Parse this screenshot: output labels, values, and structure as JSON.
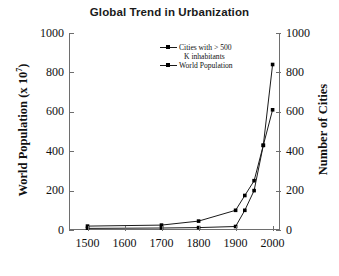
{
  "chart_data": {
    "type": "line",
    "title": "Global Trend in Urbanization",
    "xlabel": "",
    "ylabel": "World Population (x 10",
    "ylabel_exponent": "7",
    "ylabel_suffix": ")",
    "y2label": "Number of Cities",
    "xlim": [
      1450,
      2020
    ],
    "ylim": [
      0,
      1000
    ],
    "y2lim": [
      0,
      1000
    ],
    "grid": false,
    "legend_position": "top-center",
    "xticks": [
      "1500",
      "1600",
      "1700",
      "1800",
      "1900",
      "2000"
    ],
    "xtick_values": [
      1500,
      1600,
      1700,
      1800,
      1900,
      2000
    ],
    "yticks": [
      "0",
      "200",
      "400",
      "600",
      "800",
      "1000"
    ],
    "ytick_values": [
      0,
      200,
      400,
      600,
      800,
      1000
    ],
    "y2ticks": [
      "0",
      "200",
      "400",
      "600",
      "800",
      "1000"
    ],
    "y2tick_values": [
      0,
      200,
      400,
      600,
      800,
      1000
    ],
    "marker": "square",
    "line_color": "#1a1a1a",
    "marker_color": "#000000",
    "series": [
      {
        "name": "Cities with > 500 K inhabitants",
        "axis": "right",
        "x": [
          1500,
          1700,
          1800,
          1900,
          1925,
          1950,
          1975,
          2000
        ],
        "values": [
          20,
          25,
          45,
          100,
          175,
          250,
          430,
          840
        ]
      },
      {
        "name": "World Population",
        "axis": "left",
        "x": [
          1500,
          1700,
          1800,
          1900,
          1925,
          1950,
          1975,
          2000
        ],
        "values": [
          8,
          10,
          12,
          18,
          100,
          200,
          430,
          610
        ]
      }
    ]
  },
  "legend": {
    "line1": "Cities with > 500",
    "line2": "K inhabitants",
    "line3": "World Population"
  }
}
